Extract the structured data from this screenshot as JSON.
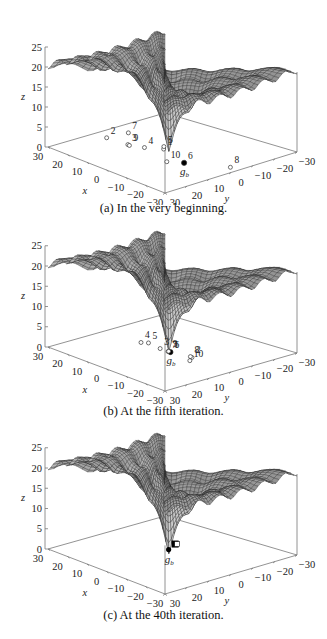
{
  "figure": {
    "panels": [
      {
        "id": "a",
        "caption": "(a) In the very beginning."
      },
      {
        "id": "b",
        "caption": "(b) At the fifth iteration."
      },
      {
        "id": "c",
        "caption": "(c) At the 40th iteration."
      }
    ]
  },
  "chart_data": [
    {
      "type": "surface3d+scatter",
      "title": "(a) In the very beginning.",
      "xlabel": "x",
      "ylabel": "y",
      "zlabel": "z",
      "xlim": [
        -30,
        30
      ],
      "ylim": [
        -30,
        30
      ],
      "zlim": [
        0,
        25
      ],
      "x_ticks": [
        "30",
        "20",
        "10",
        "0",
        "−10",
        "−20",
        "−30"
      ],
      "y_ticks": [
        "30",
        "20",
        "10",
        "0",
        "−10",
        "−20",
        "−30"
      ],
      "z_ticks": [
        "0",
        "5",
        "10",
        "15",
        "20",
        "25"
      ],
      "surface": "Ackley-like multimodal function, global minimum 0 at origin, plateau ~20",
      "particles": [
        {
          "label": "1",
          "x": 3,
          "y": 14
        },
        {
          "label": "2",
          "x": 24,
          "y": -8
        },
        {
          "label": "3",
          "x": 14,
          "y": -14
        },
        {
          "label": "4",
          "x": 8,
          "y": -18
        },
        {
          "label": "5",
          "x": 5,
          "y": 25
        },
        {
          "label": "6",
          "x": -12,
          "y": 10
        },
        {
          "label": "7",
          "x": 23,
          "y": 5
        },
        {
          "label": "8",
          "x": -26,
          "y": -4
        },
        {
          "label": "9",
          "x": 13,
          "y": -16
        },
        {
          "label": "10",
          "x": -7,
          "y": 27
        }
      ],
      "global_best": {
        "label": "g_b",
        "of": "6"
      }
    },
    {
      "type": "surface3d+scatter",
      "title": "(b) At the fifth iteration.",
      "xlabel": "x",
      "ylabel": "y",
      "zlabel": "z",
      "xlim": [
        -30,
        30
      ],
      "ylim": [
        -30,
        30
      ],
      "zlim": [
        0,
        25
      ],
      "x_ticks": [
        "30",
        "20",
        "10",
        "0",
        "−10",
        "−20",
        "−30"
      ],
      "y_ticks": [
        "30",
        "20",
        "10",
        "0",
        "−10",
        "−20",
        "−30"
      ],
      "z_ticks": [
        "0",
        "5",
        "10",
        "15",
        "20",
        "25"
      ],
      "particles": [
        {
          "label": "1",
          "x": -1,
          "y": 3
        },
        {
          "label": "2",
          "x": -10,
          "y": -3
        },
        {
          "label": "3",
          "x": 4,
          "y": -2
        },
        {
          "label": "4",
          "x": 13,
          "y": -1
        },
        {
          "label": "5",
          "x": 11,
          "y": 4
        },
        {
          "label": "6",
          "x": -1,
          "y": 2
        },
        {
          "label": "7",
          "x": 0,
          "y": 6
        },
        {
          "label": "8",
          "x": -9,
          "y": -4
        },
        {
          "label": "9",
          "x": 0,
          "y": 1
        },
        {
          "label": "10",
          "x": -12,
          "y": 4
        }
      ],
      "global_best": {
        "label": "g_b",
        "of": "6"
      }
    },
    {
      "type": "surface3d+scatter",
      "title": "(c) At the 40th iteration.",
      "xlabel": "x",
      "ylabel": "y",
      "zlabel": "z",
      "xlim": [
        -30,
        30
      ],
      "ylim": [
        -30,
        30
      ],
      "zlim": [
        0,
        25
      ],
      "x_ticks": [
        "30",
        "20",
        "10",
        "0",
        "−10",
        "−20",
        "−30"
      ],
      "y_ticks": [
        "30",
        "20",
        "10",
        "0",
        "−10",
        "−20",
        "−30"
      ],
      "z_ticks": [
        "0",
        "5",
        "10",
        "15",
        "20",
        "25"
      ],
      "particles": "all 10 particles converged near origin (clustered squares)",
      "global_best": {
        "label": "g_b",
        "x": 0,
        "y": 1
      }
    }
  ]
}
